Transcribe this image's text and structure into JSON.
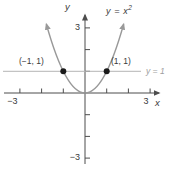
{
  "labels": {
    "curve_base": "y = x",
    "curve_exp": "2",
    "y_axis": "y",
    "x_axis": "x",
    "hline": "y = 1",
    "point_left": "(−1, 1)",
    "point_right": "(1, 1)",
    "x_tick_neg3": "−3",
    "x_tick_pos3": "3",
    "y_tick_pos3": "3",
    "y_tick_neg3": "−3"
  },
  "colors": {
    "background": "#ffffff",
    "axis": "#4d4d4d",
    "curve": "#999999",
    "hline": "#b5b5b5",
    "point": "#1a1a1a",
    "text": "#3a3a3a",
    "hline_text": "#9e9e9e"
  },
  "chart_data": {
    "type": "line",
    "title": "",
    "xlabel": "x",
    "ylabel": "y",
    "xlim": [
      -3,
      3
    ],
    "ylim": [
      -3,
      3
    ],
    "x_ticks": [
      -3,
      -2,
      -1,
      1,
      2,
      3
    ],
    "y_ticks": [
      -3,
      -2,
      -1,
      1,
      2,
      3
    ],
    "labeled_x_ticks": [
      -3,
      3
    ],
    "labeled_y_ticks": [
      -3,
      3
    ],
    "grid": false,
    "legend": false,
    "series": [
      {
        "name": "y = x²",
        "equation": "y = x^2",
        "color": "#999999",
        "x_domain": [
          -1.78,
          1.78
        ],
        "arrows_both_ends": true,
        "sample_points": [
          [
            -1.5,
            2.25
          ],
          [
            -1,
            1
          ],
          [
            -0.5,
            0.25
          ],
          [
            0,
            0
          ],
          [
            0.5,
            0.25
          ],
          [
            1,
            1
          ],
          [
            1.5,
            2.25
          ]
        ]
      }
    ],
    "reference_lines": [
      {
        "label": "y = 1",
        "y": 1,
        "color": "#b5b5b5"
      }
    ],
    "points": [
      {
        "label": "(−1, 1)",
        "x": -1,
        "y": 1
      },
      {
        "label": "(1, 1)",
        "x": 1,
        "y": 1
      }
    ]
  }
}
